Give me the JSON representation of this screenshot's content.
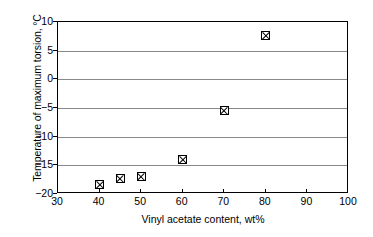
{
  "chart_data": {
    "type": "scatter",
    "title": "",
    "xlabel": "Vinyl acetate content, wt%",
    "ylabel": "Temperature of maximum torsion, °C",
    "xlim": [
      30,
      100
    ],
    "ylim": [
      -20,
      10
    ],
    "xticks": [
      30,
      40,
      50,
      60,
      70,
      80,
      90,
      100
    ],
    "yticks": [
      10,
      5,
      0,
      -5,
      -10,
      -15,
      -20
    ],
    "xtick_labels": [
      "30",
      "40",
      "50",
      "60",
      "70",
      "80",
      "90",
      "100"
    ],
    "ytick_labels": [
      "10",
      "5",
      "0",
      "−5",
      "−10",
      "−15",
      "−20"
    ],
    "grid": "horizontal",
    "legend": "none",
    "marker_style": "crossed-square",
    "marker_color": "#000000",
    "x": [
      40,
      45,
      50,
      60,
      70,
      80
    ],
    "values": [
      -18.4,
      -17.3,
      -17.0,
      -14.0,
      -5.4,
      7.7
    ],
    "points": [
      {
        "x": 40,
        "y": -18.4
      },
      {
        "x": 45,
        "y": -17.3
      },
      {
        "x": 50,
        "y": -17.0
      },
      {
        "x": 60,
        "y": -14.0
      },
      {
        "x": 70,
        "y": -5.4
      },
      {
        "x": 80,
        "y": 7.7
      }
    ]
  }
}
